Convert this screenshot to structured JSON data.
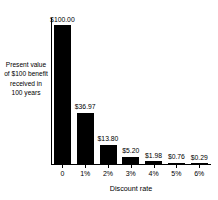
{
  "chart_data": {
    "type": "bar",
    "title": "",
    "subtitle": "",
    "xlabel": "Discount rate",
    "ylabel": "Present value\nof $100 benefit\nreceived in\n100 years",
    "categories": [
      "0",
      "1%",
      "2%",
      "3%",
      "4%",
      "5%",
      "6%"
    ],
    "values": [
      100.0,
      36.97,
      13.8,
      5.2,
      1.98,
      0.76,
      0.29
    ],
    "data_labels": [
      "$100.00",
      "$36.97",
      "$13.80",
      "$5.20",
      "$1.98",
      "$0.76",
      "$0.29"
    ],
    "ylim": [
      0,
      100
    ],
    "grid": false,
    "legend": null,
    "bar_color": "#000000",
    "axis_color": "#000000",
    "background": "#ffffff"
  }
}
